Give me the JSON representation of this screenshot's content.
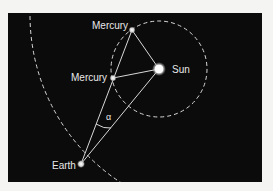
{
  "diagram": {
    "colors": {
      "background": "#f4f4f2",
      "panel": "#0b0b0b",
      "line": "#d8d8d8",
      "label": "#e8e8e8"
    },
    "bodies": [
      {
        "id": "sun",
        "label": "Sun",
        "x": 159,
        "y": 69
      },
      {
        "id": "mercury-top",
        "label": "Mercury",
        "x": 132,
        "y": 30
      },
      {
        "id": "mercury-mid",
        "label": "Mercury",
        "x": 113,
        "y": 78
      },
      {
        "id": "earth",
        "label": "Earth",
        "x": 81,
        "y": 164
      }
    ],
    "angle_label": "α",
    "orbits": [
      {
        "id": "mercury-orbit",
        "cx": 159,
        "cy": 69,
        "r": 48
      },
      {
        "id": "earth-orbit",
        "cx": 230,
        "cy": 15,
        "r": 200
      }
    ]
  }
}
